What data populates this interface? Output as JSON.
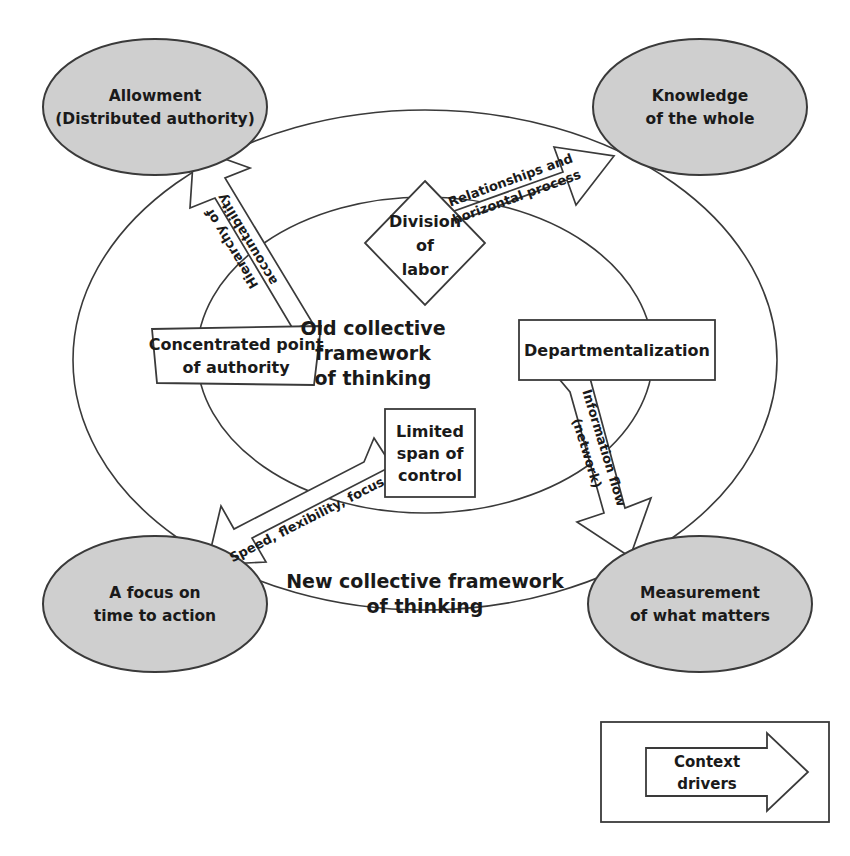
{
  "figure": {
    "type": "conceptual-framework-diagram",
    "background": "#ffffff",
    "node_fill": "#cfcfcf",
    "stroke_color": "#3a3a3a"
  },
  "outer_nodes": [
    {
      "id": "allowment",
      "line1": "Allowment",
      "line2": "(Distributed authority)",
      "position": "top-left"
    },
    {
      "id": "knowledge",
      "line1": "Knowledge",
      "line2": "of the whole",
      "position": "top-right"
    },
    {
      "id": "focus-time",
      "line1": "A focus on",
      "line2": "time to action",
      "position": "bottom-left"
    },
    {
      "id": "measurement",
      "line1": "Measurement",
      "line2": "of what matters",
      "position": "bottom-right"
    }
  ],
  "inner_nodes": [
    {
      "id": "division-of-labor",
      "shape": "diamond",
      "line1": "Division",
      "line2": "of",
      "line3": "labor",
      "position": "top-center"
    },
    {
      "id": "concentrated-authority",
      "shape": "skewed-box",
      "line1": "Concentrated point",
      "line2": "of authority",
      "position": "left"
    },
    {
      "id": "departmentalization",
      "shape": "rectangle",
      "line1": "Departmentalization",
      "line2": "",
      "position": "right"
    },
    {
      "id": "limited-span",
      "shape": "rectangle",
      "line1": "Limited",
      "line2": "span of",
      "line3": "control",
      "position": "bottom-center"
    }
  ],
  "framework_labels": {
    "old": {
      "line1": "Old collective",
      "line2": "framework",
      "line3": "of thinking"
    },
    "new": {
      "line1": "New collective framework",
      "line2": "of thinking"
    }
  },
  "context_drivers": [
    {
      "id": "hierarchy-accountability",
      "line1": "Hierarchy of",
      "line2": "accountability",
      "from": "concentrated-authority",
      "to": "allowment"
    },
    {
      "id": "relationships-horizontal",
      "line1": "Relationships and",
      "line2": "horizontal process",
      "from": "division-of-labor",
      "to": "knowledge"
    },
    {
      "id": "speed-flexibility-focus",
      "line1": "Speed, flexibility, focus",
      "line2": "",
      "from": "limited-span",
      "to": "focus-time"
    },
    {
      "id": "information-flow",
      "line1": "Information flow",
      "line2": "(network)",
      "from": "departmentalization",
      "to": "measurement"
    }
  ],
  "legend": {
    "line1": "Context",
    "line2": "drivers"
  }
}
